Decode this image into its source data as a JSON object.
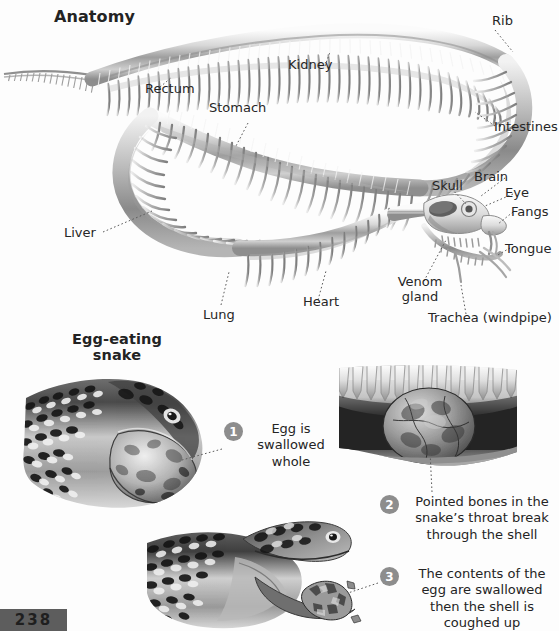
{
  "page": {
    "number": "238",
    "background": "#fdfdfd",
    "text_color": "#262626",
    "step_bullet_color": "#8d8d8d",
    "plate_color": "#5d5d5d"
  },
  "anatomy": {
    "title": "Anatomy",
    "labels": [
      {
        "id": "rectum",
        "text": "Rectum"
      },
      {
        "id": "kidney",
        "text": "Kidney"
      },
      {
        "id": "rib",
        "text": "Rib"
      },
      {
        "id": "stomach",
        "text": "Stomach"
      },
      {
        "id": "intestines",
        "text": "Intestines"
      },
      {
        "id": "brain",
        "text": "Brain"
      },
      {
        "id": "skull",
        "text": "Skull"
      },
      {
        "id": "eye",
        "text": "Eye"
      },
      {
        "id": "fangs",
        "text": "Fangs"
      },
      {
        "id": "tongue",
        "text": "Tongue"
      },
      {
        "id": "liver",
        "text": "Liver"
      },
      {
        "id": "venom",
        "text": "Venom\ngland"
      },
      {
        "id": "venom_l1",
        "text": "Venom"
      },
      {
        "id": "venom_l2",
        "text": "gland"
      },
      {
        "id": "lung",
        "text": "Lung"
      },
      {
        "id": "heart",
        "text": "Heart"
      },
      {
        "id": "trachea",
        "text": "Trachea (windpipe)"
      }
    ]
  },
  "egg_eating": {
    "title_line1": "Egg-eating",
    "title_line2": "snake",
    "title": "Egg-eating snake",
    "steps": [
      {
        "number": "1",
        "text": "Egg is swallowed whole"
      },
      {
        "number": "2",
        "text": "Pointed bones in the snake’s throat break through the shell"
      },
      {
        "number": "3",
        "text": "The contents of the egg are swallowed then the shell is coughed up"
      }
    ]
  },
  "figures": [
    {
      "id": "snake-skeleton-diagram",
      "caption": "Grey-scale cutaway illustration of a snake skeleton arranged in an S-curve, head at lower right"
    },
    {
      "id": "egg-swallow-photo-1",
      "caption": "Photograph of an egg-eating snake with an egg bulging inside its distended mouth"
    },
    {
      "id": "throat-cutaway-photo-2",
      "caption": "Cutaway illustration of the snake throat showing pointed vertebral bones pressing into the egg"
    },
    {
      "id": "shell-cough-photo-3",
      "caption": "Photograph of the snake with mouth open expelling the collapsed egg shell"
    }
  ]
}
